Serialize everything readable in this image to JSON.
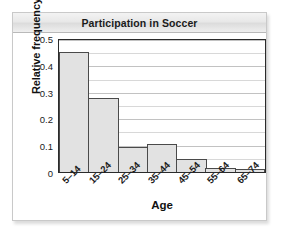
{
  "card": {
    "title": "Participation in Soccer"
  },
  "chart_data": {
    "type": "bar",
    "title": "Participation in Soccer",
    "xlabel": "Age",
    "ylabel": "Relative frequency",
    "categories": [
      "5–14",
      "15–24",
      "25–34",
      "35–44",
      "45–54",
      "55–64",
      "65–74"
    ],
    "values": [
      0.455,
      0.28,
      0.093,
      0.105,
      0.049,
      0.015,
      0.013
    ],
    "ylim": [
      0,
      0.5
    ],
    "ytick_labels": [
      "0",
      "0.1",
      "0.2",
      "0.3",
      "0.4",
      "0.5"
    ],
    "ytick_values": [
      0,
      0.1,
      0.2,
      0.3,
      0.4,
      0.5
    ],
    "gridlines": true,
    "gridline_step": 0.05,
    "legend": "none",
    "bar_fill_color": "#e2e2e2",
    "bar_border_color": "#4a4a4a"
  }
}
